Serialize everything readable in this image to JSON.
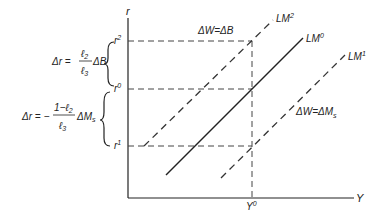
{
  "diagram": {
    "axes": {
      "y_label": "r",
      "x_label": "Y"
    },
    "levels": {
      "r2": {
        "base": "r",
        "sup": "2"
      },
      "r0": {
        "base": "r",
        "sup": "0"
      },
      "r1": {
        "base": "r",
        "sup": "1"
      },
      "Y0": {
        "base": "Y",
        "sup": "0"
      }
    },
    "curves": {
      "lm0": {
        "base": "LM",
        "sup": "0",
        "style": "solid"
      },
      "lm2": {
        "base": "LM",
        "sup": "2",
        "style": "dashed"
      },
      "lm1": {
        "base": "LM",
        "sup": "1",
        "style": "dashed"
      }
    },
    "annotations": {
      "shift_up": "ΔW=ΔB",
      "shift_down_prefix": "ΔW=ΔM",
      "shift_down_sub": "s"
    },
    "formulas": {
      "upper": {
        "lhs": "Δr =",
        "num": "ℓ",
        "num_sub": "2",
        "den": "ℓ",
        "den_sub": "3",
        "tail": "ΔB"
      },
      "lower": {
        "lhs": "Δr = −",
        "num": "1−ℓ",
        "num_sub": "2",
        "den": "ℓ",
        "den_sub": "3",
        "tail": "ΔM",
        "tail_sub": "s"
      }
    },
    "colors": {
      "line": "#222222",
      "dash": "#444444",
      "background": "#ffffff"
    }
  }
}
